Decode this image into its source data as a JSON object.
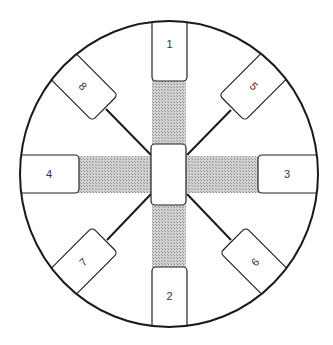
{
  "diagram": {
    "type": "radial-layout",
    "colors": {
      "line": "#1a1a1a",
      "hatch": "#bdbdbd",
      "box_fill": "#ffffff"
    },
    "outer_circle": {
      "cx": 169,
      "cy": 174,
      "rx": 149,
      "ry": 153
    },
    "center_box": {
      "label": ""
    },
    "boxes": [
      {
        "id": "1",
        "label": "1",
        "position": "top",
        "connection": "hatched-strip"
      },
      {
        "id": "2",
        "label": "2",
        "position": "bottom",
        "connection": "hatched-strip"
      },
      {
        "id": "3",
        "label": "3",
        "position": "right",
        "connection": "hatched-strip"
      },
      {
        "id": "4",
        "label": "4",
        "position": "left",
        "connection": "hatched-strip"
      },
      {
        "id": "5",
        "label": "5",
        "position": "top-right",
        "connection": "line"
      },
      {
        "id": "6",
        "label": "6",
        "position": "bottom-right",
        "connection": "line"
      },
      {
        "id": "7",
        "label": "7",
        "position": "bottom-left",
        "connection": "line"
      },
      {
        "id": "8",
        "label": "8",
        "position": "top-left",
        "connection": "line"
      }
    ]
  }
}
